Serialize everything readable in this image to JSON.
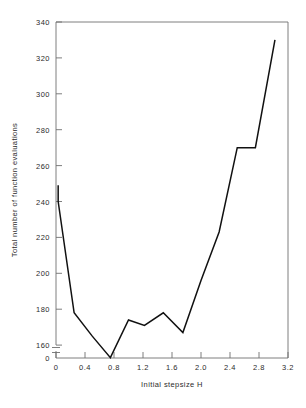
{
  "chart_data": {
    "type": "line",
    "title": "",
    "xlabel": "Initial stepsize H",
    "ylabel": "Total number of function evaluations",
    "xlim": [
      0,
      3.2
    ],
    "ylim": [
      150,
      340
    ],
    "y_axis_break": true,
    "y_break_label": "0",
    "grid": false,
    "legend": null,
    "xticks": [
      "0",
      "0.4",
      "0.8",
      "1.2",
      "1.6",
      "2.0",
      "2.4",
      "2.8",
      "3.2"
    ],
    "xtick_values": [
      0,
      0.4,
      0.8,
      1.2,
      1.6,
      2.0,
      2.4,
      2.8,
      3.2
    ],
    "yticks": [
      "160",
      "180",
      "200",
      "220",
      "240",
      "260",
      "280",
      "300",
      "320",
      "340"
    ],
    "ytick_values": [
      160,
      180,
      200,
      220,
      240,
      260,
      280,
      300,
      320,
      340
    ],
    "series": [
      {
        "name": "Total function evaluations",
        "x": [
          0.03,
          0.03,
          0.25,
          0.5,
          0.75,
          1.0,
          1.22,
          1.48,
          1.75,
          2.0,
          2.25,
          2.5,
          2.75,
          3.02
        ],
        "y": [
          249,
          240,
          178,
          165,
          153,
          174,
          171,
          178,
          167,
          196,
          223,
          270,
          270,
          330
        ]
      }
    ]
  },
  "axes": {
    "x_axis_label": "Initial stepsize H",
    "y_axis_label": "Total number of function evaluations"
  }
}
